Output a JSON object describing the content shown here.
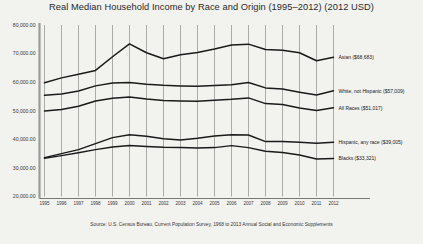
{
  "chart_data": {
    "type": "line",
    "title": "Real Median Household Income by Race and Origin (1995–2012) (2012 USD)",
    "xlabel": "",
    "ylabel": "",
    "grid": "vertical",
    "legend_position": "right-inline",
    "ylim": [
      20000,
      80000
    ],
    "yticks": [
      20000,
      30000,
      40000,
      50000,
      60000,
      70000,
      80000
    ],
    "ytick_labels": [
      "20,000.00",
      "30,000.00",
      "40,000.00",
      "50,000.00",
      "60,000.00",
      "70,000.00",
      "80,000.00"
    ],
    "x": [
      1995,
      1996,
      1997,
      1998,
      1999,
      2000,
      2001,
      2002,
      2003,
      2004,
      2005,
      2006,
      2007,
      2008,
      2009,
      2010,
      2011,
      2012
    ],
    "xtick_labels": [
      "1995",
      "1996",
      "1997",
      "1998",
      "1999",
      "2000",
      "2001",
      "2002",
      "2003",
      "2004",
      "2005",
      "2006",
      "2007",
      "2008",
      "2009",
      "2010",
      "2011",
      "2012"
    ],
    "series": [
      {
        "name": "Asian",
        "label": "Asian ($68,683)",
        "end_value": 68683,
        "values": [
          59800,
          61500,
          62800,
          64100,
          68900,
          73400,
          70300,
          68200,
          69600,
          70400,
          71600,
          73000,
          73300,
          71400,
          71200,
          70300,
          67500,
          68683
        ]
      },
      {
        "name": "White, not Hispanic",
        "label": "White, not Hispanic ($57,009)",
        "end_value": 57009,
        "values": [
          55400,
          55900,
          56900,
          58700,
          59700,
          59900,
          59300,
          58900,
          58700,
          58600,
          58800,
          59100,
          59900,
          58000,
          57600,
          56500,
          55500,
          57009
        ]
      },
      {
        "name": "All Races",
        "label": "All Races ($51,017)",
        "end_value": 51017,
        "values": [
          49900,
          50400,
          51600,
          53400,
          54400,
          54800,
          54100,
          53600,
          53400,
          53300,
          53700,
          54000,
          54500,
          52500,
          52200,
          51000,
          50100,
          51017
        ]
      },
      {
        "name": "Hispanic, any race",
        "label": "Hispanic, any race ($39,005)",
        "end_value": 39005,
        "values": [
          33600,
          35000,
          36400,
          38500,
          40600,
          41600,
          41100,
          40200,
          39800,
          40400,
          41200,
          41600,
          41500,
          39200,
          39200,
          39000,
          38600,
          39005
        ]
      },
      {
        "name": "Blacks",
        "label": "Blacks ($33,321)",
        "end_value": 33321,
        "values": [
          33400,
          34300,
          35300,
          36400,
          37300,
          37800,
          37500,
          37200,
          37100,
          37000,
          37100,
          37800,
          37100,
          35800,
          35400,
          34500,
          33100,
          33321
        ]
      }
    ],
    "source": "Source: U.S. Census Bureau, Current Population Survey, 1968 to 2013 Annual Social and Economic Supplements",
    "colors": {
      "line": "#1a1a1a",
      "grid": "#8c8c8c",
      "axis": "#5a5a5a",
      "background": "#f2f2ef",
      "text": "#2a2a2a"
    }
  }
}
